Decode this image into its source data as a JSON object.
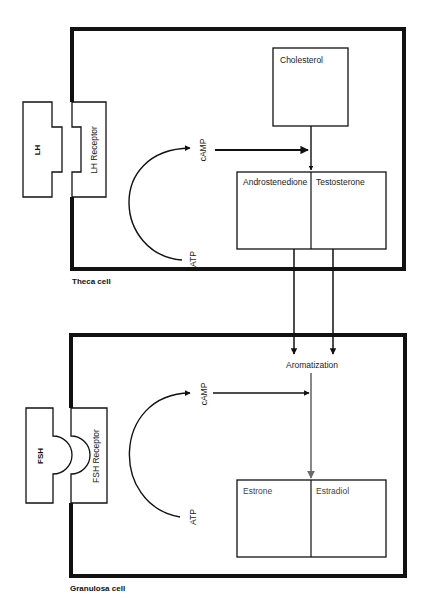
{
  "diagram": {
    "theca": {
      "cell_label": "Theca cell",
      "ligand": "LH",
      "receptor": "LH Receptor",
      "second_messenger": "cAMP",
      "substrate": "ATP",
      "precursor": "Cholesterol",
      "products": [
        "Androstenedione",
        "Testosterone"
      ]
    },
    "granulosa": {
      "cell_label": "Granulosa cell",
      "ligand": "FSH",
      "receptor": "FSH Receptor",
      "second_messenger": "cAMP",
      "substrate": "ATP",
      "process": "Aromatization",
      "products": [
        "Estrone",
        "Estradiol"
      ]
    }
  },
  "colors": {
    "line": "#111111",
    "aromatization_arrow": "#6b6b6b"
  }
}
